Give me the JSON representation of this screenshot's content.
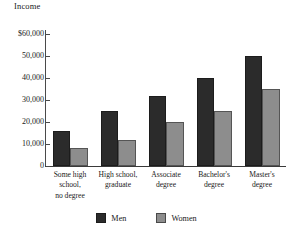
{
  "chart_data": {
    "type": "bar",
    "title": "",
    "ylabel": "Income",
    "xlabel": "",
    "ylim": [
      0,
      60000
    ],
    "ytick_values": [
      0,
      10000,
      20000,
      30000,
      40000,
      50000,
      60000
    ],
    "ytick_labels": [
      "0",
      "10,000",
      "20,000",
      "30,000",
      "40,000",
      "50,000",
      "$60,000"
    ],
    "grid": false,
    "legend_position": "bottom",
    "categories": [
      "Some high\nschool,\nno degree",
      "High school,\ngraduate",
      "Associate\ndegree",
      "Bachelor's\ndegree",
      "Master's\ndegree"
    ],
    "series": [
      {
        "name": "Men",
        "color": "#2b2b2b",
        "values": [
          16000,
          25000,
          32000,
          40000,
          50000
        ]
      },
      {
        "name": "Women",
        "color": "#8d8d8d",
        "values": [
          8000,
          12000,
          20000,
          25000,
          35000
        ]
      }
    ]
  }
}
